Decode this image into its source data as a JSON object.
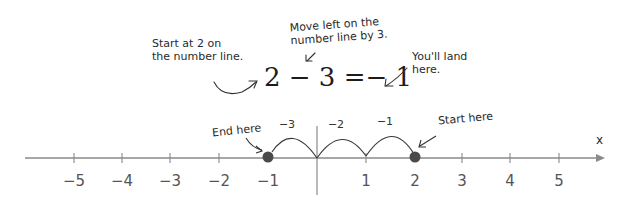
{
  "annotations": {
    "start_at": [
      "Start at 2 on",
      "the number line."
    ],
    "move_left": [
      "Move left on the",
      "number line by 3."
    ],
    "you_land": [
      "You'll land",
      "here."
    ],
    "end_here": "End here",
    "start_here": "Start here"
  },
  "equation": "2 − 3 =− 1",
  "number_line": {
    "axis_label": "x",
    "ticks": [
      {
        "value": -5,
        "label": "−5",
        "x": 74
      },
      {
        "value": -4,
        "label": "−4",
        "x": 122
      },
      {
        "value": -3,
        "label": "−3",
        "x": 170
      },
      {
        "value": -2,
        "label": "−2",
        "x": 219
      },
      {
        "value": -1,
        "label": "−1",
        "x": 268
      },
      {
        "value": 0,
        "label": "",
        "x": 317
      },
      {
        "value": 1,
        "label": "1",
        "x": 366
      },
      {
        "value": 2,
        "label": "2",
        "x": 415
      },
      {
        "value": 3,
        "label": "3",
        "x": 462
      },
      {
        "value": 4,
        "label": "4",
        "x": 510
      },
      {
        "value": 5,
        "label": "5",
        "x": 559
      }
    ],
    "jumps": [
      {
        "label": "−1",
        "from": 2,
        "to": 1
      },
      {
        "label": "−2",
        "from": 1,
        "to": 0
      },
      {
        "label": "−3",
        "from": 0,
        "to": -1
      }
    ],
    "start_point": 2,
    "end_point": -1
  },
  "colors": {
    "line": "#8a8a8a",
    "point": "#4a4a4a",
    "text": "#333333"
  }
}
